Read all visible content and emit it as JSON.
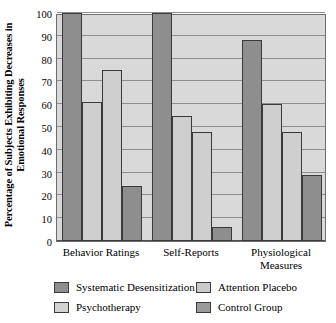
{
  "chart_data": {
    "type": "bar",
    "title": "",
    "xlabel": "",
    "ylabel": "Percentage of Subjects Exhibiting Decreases in Emotional Responses",
    "ylim": [
      0,
      100
    ],
    "ytick_step": 10,
    "yticks": [
      "0",
      "10",
      "20",
      "30",
      "40",
      "50",
      "60",
      "70",
      "80",
      "90",
      "100"
    ],
    "grid": true,
    "legend_position": "bottom",
    "categories": [
      "Behavior Ratings",
      "Self-Reports",
      "Physiological\nMeasures"
    ],
    "series": [
      {
        "name": "Systematic Desensitization",
        "color": "#8e8e8e",
        "values": [
          100,
          100,
          88
        ]
      },
      {
        "name": "Psychotherapy",
        "color": "#d2d2d2",
        "values": [
          61,
          55,
          60
        ]
      },
      {
        "name": "Attention Placebo",
        "color": "#cacaca",
        "values": [
          75,
          48,
          48
        ]
      },
      {
        "name": "Control Group",
        "color": "#9a9a9a",
        "values": [
          24,
          6,
          29
        ]
      }
    ]
  },
  "legend": {
    "items": [
      {
        "label": "Systematic Desensitization"
      },
      {
        "label": "Psychotherapy"
      },
      {
        "label": "Attention Placebo"
      },
      {
        "label": "Control Group"
      }
    ]
  }
}
